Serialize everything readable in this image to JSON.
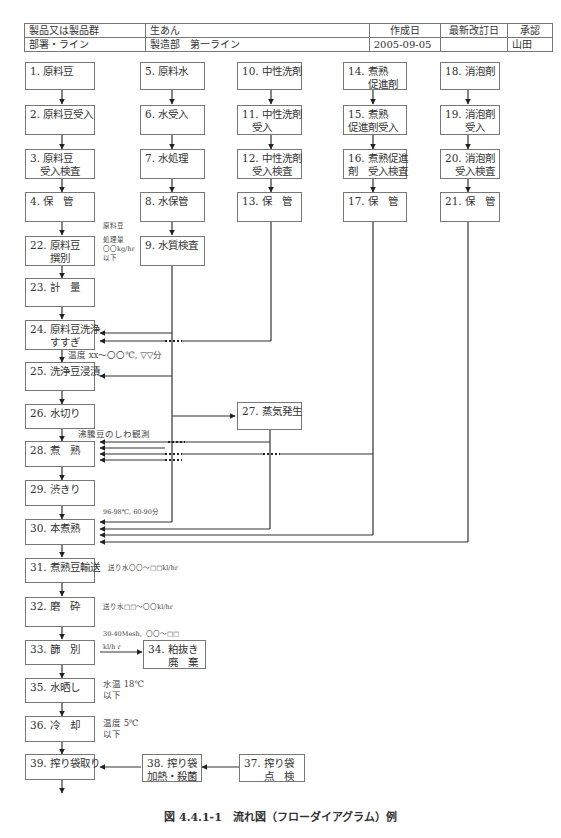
{
  "header_table": {
    "row1": {
      "label": "製品又は製品群",
      "value": "生あん",
      "created_label": "作成日",
      "revised_label": "最新改訂日",
      "approval_label": "承認"
    },
    "row2": {
      "label": "部署・ライン",
      "value": "製造部　第一ライン",
      "created_value": "2005-09-05",
      "revised_value": "",
      "approval_value": "山田"
    }
  },
  "steps": {
    "s1": "1. 原料豆",
    "s2": "2. 原料豆受入",
    "s3": "3. 原料豆\n　受入検査",
    "s4": "4. 保　管",
    "s5": "5. 原料水",
    "s6": "6. 水受入",
    "s7": "7. 水処理",
    "s8": "8. 水保管",
    "s9": "9. 水質検査",
    "s10": "10. 中性洗剤",
    "s11": "11. 中性洗剤\n　受入",
    "s12": "12. 中性洗剤\n　受入検査",
    "s13": "13. 保　管",
    "s14": "14. 煮熟\n　　促進剤",
    "s15": "15. 煮熟\n促進剤受入",
    "s16": "16. 煮熟促進\n剤　受入検査",
    "s17": "17. 保　管",
    "s18": "18. 消泡剤",
    "s19": "19. 消泡剤\n　　受入",
    "s20": "20. 消泡剤\n　受入検査",
    "s21": "21. 保　管",
    "s22": "22. 原料豆\n　　撰別",
    "s23": "23. 計　量",
    "s24": "24. 原料豆洗浄\n　　すすぎ",
    "s25": "25. 洗浄豆浸漬",
    "s26": "26. 水切り",
    "s27": "27. 蒸気発生",
    "s28": "28. 煮　熟",
    "s29": "29. 渋きり",
    "s30": "30. 本煮熟",
    "s31": "31. 煮熟豆輸送",
    "s32": "32. 磨　砕",
    "s33": "33. 篩　別",
    "s34": "34. 粕抜き\n　　廃　棄",
    "s35": "35. 水晒し",
    "s36": "36. 冷　却",
    "s37": "37. 搾り袋\n　　点　検",
    "s38": "38. 搾り袋\n加熱・殺菌",
    "s39": "39. 搾り袋取り"
  },
  "notes": {
    "n22a": "原料豆",
    "n22b": "処理量\n〇〇kg/hr\n以下",
    "n24": "温度 xx〜〇〇℃, ▽▽分",
    "n28": "沸騰豆のしわ観測",
    "n30": "96-98℃, 60-90分",
    "n31": "送り水〇〇〜□□kl/hr",
    "n32": "送り水□□〜〇〇kl/hr",
    "n33a": "30-40Mesh,  〇〇〜□□",
    "n33b": "kl/h r",
    "n35": "水温 18℃\n以下",
    "n36": "温度 5℃\n以下"
  },
  "caption": "図 4.4.1-1　流れ図（フローダイアグラム）例"
}
